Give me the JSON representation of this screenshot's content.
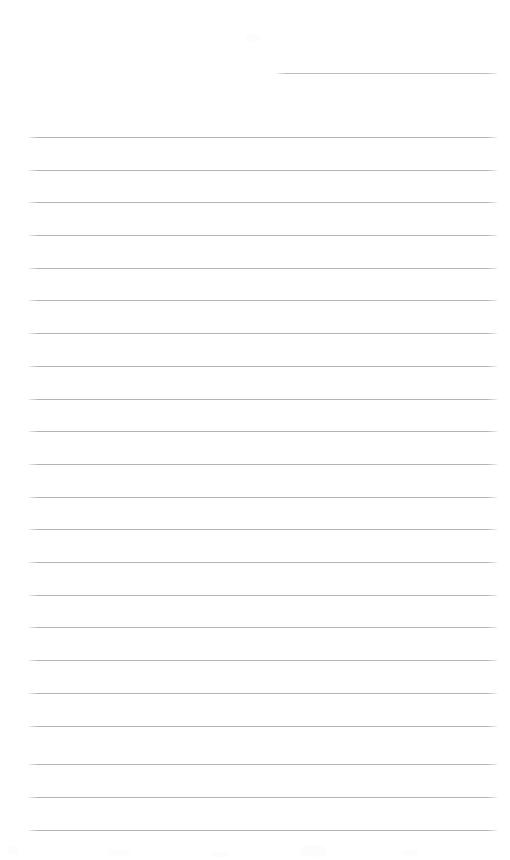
{
  "page": {
    "name": "ruled-notepad-page",
    "width": 510,
    "height": 860,
    "background_color": "#ffffff",
    "content_text": "",
    "is_blank": true
  },
  "rules": {
    "line_color": "#b3b3b7",
    "line_thickness_px": 1,
    "spacing_px": 32.7,
    "left_x": 28,
    "right_x": 497,
    "partial_rule": {
      "label": "header-rule",
      "y": 73,
      "x_start": 276,
      "x_end": 497,
      "color": "#bcbcc0",
      "text": ""
    },
    "full_rules": [
      {
        "index": 1,
        "y": 137,
        "text": ""
      },
      {
        "index": 2,
        "y": 170,
        "text": ""
      },
      {
        "index": 3,
        "y": 202,
        "text": ""
      },
      {
        "index": 4,
        "y": 235,
        "text": ""
      },
      {
        "index": 5,
        "y": 268,
        "text": ""
      },
      {
        "index": 6,
        "y": 300,
        "text": ""
      },
      {
        "index": 7,
        "y": 333,
        "text": ""
      },
      {
        "index": 8,
        "y": 366,
        "text": ""
      },
      {
        "index": 9,
        "y": 399,
        "text": ""
      },
      {
        "index": 10,
        "y": 431,
        "text": ""
      },
      {
        "index": 11,
        "y": 464,
        "text": ""
      },
      {
        "index": 12,
        "y": 497,
        "text": ""
      },
      {
        "index": 13,
        "y": 529,
        "text": ""
      },
      {
        "index": 14,
        "y": 562,
        "text": ""
      },
      {
        "index": 15,
        "y": 595,
        "text": ""
      },
      {
        "index": 16,
        "y": 627,
        "text": ""
      },
      {
        "index": 17,
        "y": 660,
        "text": ""
      },
      {
        "index": 18,
        "y": 693,
        "text": ""
      },
      {
        "index": 19,
        "y": 726,
        "text": ""
      },
      {
        "index": 20,
        "y": 764,
        "text": ""
      },
      {
        "index": 21,
        "y": 797,
        "text": ""
      },
      {
        "index": 22,
        "y": 830,
        "text": ""
      }
    ]
  },
  "artifacts": [
    {
      "name": "scan-smudge-top",
      "x": 246,
      "y": 34,
      "w": 14,
      "h": 8
    },
    {
      "name": "scan-smudge-bottom-left",
      "x": 8,
      "y": 846,
      "w": 10,
      "h": 9
    },
    {
      "name": "scan-smudge-bottom-mid",
      "x": 108,
      "y": 850,
      "w": 22,
      "h": 6
    },
    {
      "name": "scan-smudge-bottom-midb",
      "x": 210,
      "y": 852,
      "w": 18,
      "h": 5
    },
    {
      "name": "scan-smudge-bottom-midc",
      "x": 300,
      "y": 845,
      "w": 26,
      "h": 12
    },
    {
      "name": "scan-smudge-bottom-right",
      "x": 402,
      "y": 850,
      "w": 16,
      "h": 6
    }
  ]
}
